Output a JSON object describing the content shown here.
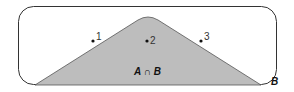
{
  "diagram": {
    "type": "venn-set-diagram",
    "colors": {
      "background": "#ffffff",
      "outline": "#333333",
      "intersection_fill": "#bdbdbd",
      "text": "#111111"
    },
    "set_b_label": "B",
    "intersection_label": "A ∩ B",
    "points": [
      {
        "label": "1",
        "x": 93,
        "y": 41
      },
      {
        "label": "2",
        "x": 147,
        "y": 41
      },
      {
        "label": "3",
        "x": 201,
        "y": 41
      }
    ]
  }
}
